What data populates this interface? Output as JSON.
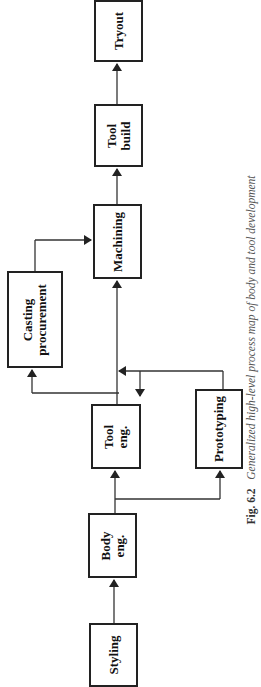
{
  "diagram": {
    "type": "process-flow",
    "orientation": "rotated-90-ccw",
    "nodes": [
      {
        "id": "styling",
        "label": "Styling"
      },
      {
        "id": "body_eng",
        "label": "Body\neng."
      },
      {
        "id": "tool_eng",
        "label": "Tool\neng."
      },
      {
        "id": "prototyping",
        "label": "Prototyping"
      },
      {
        "id": "casting",
        "label": "Casting\nprocurement"
      },
      {
        "id": "machining",
        "label": "Machining"
      },
      {
        "id": "tool_build",
        "label": "Tool\nbuild"
      },
      {
        "id": "tryout",
        "label": "Tryout"
      }
    ],
    "edges": [
      {
        "from": "styling",
        "to": "body_eng"
      },
      {
        "from": "body_eng",
        "to": "tool_eng"
      },
      {
        "from": "body_eng",
        "to": "prototyping"
      },
      {
        "from": "prototyping",
        "to": "tool_eng"
      },
      {
        "from": "tool_eng",
        "to": "casting"
      },
      {
        "from": "tool_eng",
        "to": "machining"
      },
      {
        "from": "casting",
        "to": "machining"
      },
      {
        "from": "machining",
        "to": "tool_build"
      },
      {
        "from": "tool_build",
        "to": "tryout"
      }
    ]
  },
  "caption": {
    "fig": "Fig. 6.2",
    "text": "Generalized high-level process map of body and tool development"
  },
  "colors": {
    "line": "#222222",
    "background": "#ffffff"
  }
}
